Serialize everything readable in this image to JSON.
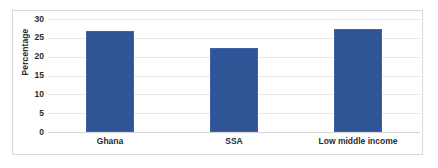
{
  "chart_data": {
    "type": "bar",
    "title": "",
    "subtitle": "",
    "xlabel": "",
    "ylabel": "Percentage",
    "categories": [
      "Ghana",
      "SSA",
      "Low middle income"
    ],
    "values": [
      26.9,
      22.4,
      27.4
    ],
    "series": [
      {
        "name": "Percentage",
        "values": [
          26.9,
          22.4,
          27.4
        ],
        "color": "#2f5597"
      }
    ],
    "ylim": [
      0,
      30
    ],
    "y_ticks": [
      0,
      5,
      10,
      15,
      20,
      25,
      30
    ],
    "y_tick_labels": [
      "0",
      "5",
      "10",
      "15",
      "20",
      "25",
      "30"
    ],
    "x_tick_labels": [
      "Ghana",
      "SSA",
      "Low middle income"
    ],
    "grid": true,
    "grid_axis": "y",
    "legend": false,
    "legend_position": "none",
    "annotations": [],
    "data_labels": false
  },
  "style": {
    "bar_color": "#2f5597",
    "bar_border_color": "#3a63ab",
    "gridline_color": "#e8e8e8",
    "baseline_color": "#d6d6d6",
    "frame_color": "#d9d9d9",
    "background_color": "#ffffff",
    "text_color": "#2b2b2b"
  }
}
